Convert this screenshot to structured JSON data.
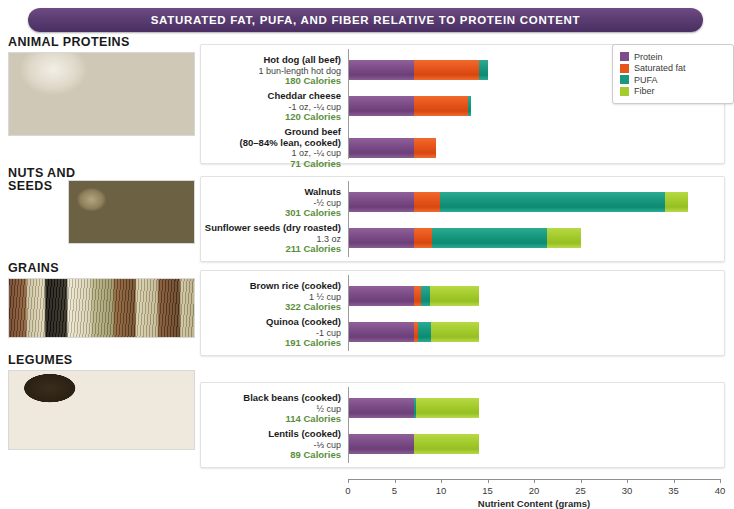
{
  "banner": {
    "title": "SATURATED FAT, PUFA, AND FIBER RELATIVE TO PROTEIN CONTENT"
  },
  "categories": [
    {
      "title": "ANIMAL PROTEINS",
      "photo": "animal-proteins-photo"
    },
    {
      "title": "NUTS AND SEEDS",
      "photo": "nuts-and-seeds-photo"
    },
    {
      "title": "GRAINS",
      "photo": "grains-photo"
    },
    {
      "title": "LEGUMES",
      "photo": "legumes-photo"
    }
  ],
  "legend": {
    "items": [
      {
        "label": "Protein",
        "color": "#7c4d88"
      },
      {
        "label": "Saturated fat",
        "color": "#e7551c"
      },
      {
        "label": "PUFA",
        "color": "#18997f"
      },
      {
        "label": "Fiber",
        "color": "#a5cc2f"
      }
    ]
  },
  "axis": {
    "title": "Nutrient Content (grams)",
    "ticks": [
      "0",
      "5",
      "10",
      "15",
      "20",
      "25",
      "30",
      "35",
      "40"
    ]
  },
  "chart_data": {
    "type": "bar",
    "orientation": "horizontal",
    "stacked": true,
    "title": "SATURATED FAT, PUFA, AND FIBER RELATIVE TO PROTEIN CONTENT",
    "xlabel": "Nutrient Content (grams)",
    "ylabel": "",
    "xlim": [
      0,
      40
    ],
    "xticks": [
      0,
      5,
      10,
      15,
      20,
      25,
      30,
      35,
      40
    ],
    "grid": false,
    "legend_position": "top-right",
    "series": [
      {
        "name": "Protein",
        "color": "#7c4d88"
      },
      {
        "name": "Saturated fat",
        "color": "#e7551c"
      },
      {
        "name": "PUFA",
        "color": "#18997f"
      },
      {
        "name": "Fiber",
        "color": "#a5cc2f"
      }
    ],
    "groups": [
      {
        "group": "ANIMAL PROTEINS",
        "items": [
          {
            "name": "Hot dog (all beef)",
            "serving": "1 bun-length hot dog",
            "calories": "180 Calories",
            "protein": 7.0,
            "saturated_fat": 7.0,
            "pufa": 1.0,
            "fiber": 0.0
          },
          {
            "name": "Cheddar cheese",
            "serving": "-1 oz, -¼ cup",
            "calories": "120 Calories",
            "protein": 7.0,
            "saturated_fat": 5.8,
            "pufa": 0.3,
            "fiber": 0.0
          },
          {
            "name": "Ground beef",
            "serving_line2": "(80–84% lean, cooked)",
            "serving": "1 oz, -¼ cup",
            "calories": "71 Calories",
            "protein": 7.0,
            "saturated_fat": 2.4,
            "pufa": 0.0,
            "fiber": 0.0
          }
        ]
      },
      {
        "group": "NUTS AND SEEDS",
        "items": [
          {
            "name": "Walnuts",
            "serving": "-½ cup",
            "calories": "301 Calories",
            "protein": 7.0,
            "saturated_fat": 2.8,
            "pufa": 24.2,
            "fiber": 2.5
          },
          {
            "name": "Sunflower seeds (dry roasted)",
            "serving": "1.3 oz",
            "calories": "211 Calories",
            "protein": 7.0,
            "saturated_fat": 1.9,
            "pufa": 12.4,
            "fiber": 3.7
          }
        ]
      },
      {
        "group": "GRAINS",
        "items": [
          {
            "name": "Brown rice (cooked)",
            "serving": "1 ½ cup",
            "calories": "322 Calories",
            "protein": 7.0,
            "saturated_fat": 0.7,
            "pufa": 1.0,
            "fiber": 5.3
          },
          {
            "name": "Quinoa (cooked)",
            "serving": "-1 cup",
            "calories": "191 Calories",
            "protein": 7.0,
            "saturated_fat": 0.4,
            "pufa": 1.4,
            "fiber": 5.2
          }
        ]
      },
      {
        "group": "LEGUMES",
        "items": [
          {
            "name": "Black beans (cooked)",
            "serving": "½ cup",
            "calories": "114 Calories",
            "protein": 7.0,
            "saturated_fat": 0.0,
            "pufa": 0.2,
            "fiber": 6.8
          },
          {
            "name": "Lentils (cooked)",
            "serving": "-⅓ cup",
            "calories": "89 Calories",
            "protein": 7.0,
            "saturated_fat": 0.0,
            "pufa": 0.0,
            "fiber": 7.0
          }
        ]
      }
    ]
  }
}
